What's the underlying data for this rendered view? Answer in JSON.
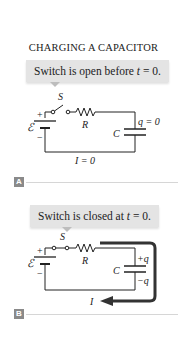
{
  "title": "CHARGING A CAPACITOR",
  "panels": [
    {
      "id": "A",
      "callout": {
        "text_before": "Switch is open before ",
        "var": "t",
        "text_after": " = 0."
      },
      "labels": {
        "switch": "S",
        "resistor": "R",
        "capacitor": "C",
        "emf": "ℰ",
        "plus": "+",
        "minus": "−",
        "charge": "q = 0",
        "current": "I = 0"
      },
      "switch_state": "open"
    },
    {
      "id": "B",
      "callout": {
        "text_before": "Switch is closed at ",
        "var": "t",
        "text_after": " = 0."
      },
      "labels": {
        "switch": "S",
        "resistor": "R",
        "capacitor": "C",
        "emf": "ℰ",
        "plus": "+",
        "minus": "−",
        "charge_top": "+q",
        "charge_bottom": "−q",
        "current": "I"
      },
      "switch_state": "closed"
    }
  ],
  "colors": {
    "callout_bg": "#e4e4e4",
    "wire": "#222222",
    "current_arrow": "#333333",
    "label_badge": "#8a8a8a",
    "divider": "#d6d6d6"
  }
}
